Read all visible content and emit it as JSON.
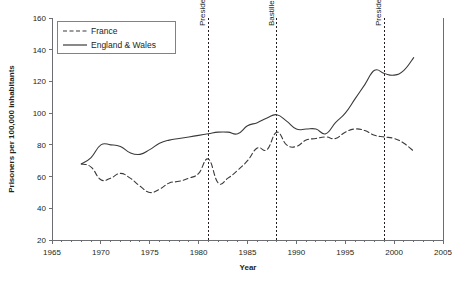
{
  "chart_data": {
    "type": "line",
    "title": "",
    "xlabel": "Year",
    "ylabel": "Prisoners per 100,000 inhabitants",
    "xlim": [
      1965,
      2005
    ],
    "ylim": [
      20,
      160
    ],
    "x_ticks": [
      1965,
      1970,
      1975,
      1980,
      1985,
      1990,
      1995,
      2000,
      2005
    ],
    "y_ticks": [
      20,
      40,
      60,
      80,
      100,
      120,
      140,
      160
    ],
    "x_minor_tick_step": 1,
    "grid": false,
    "legend_position": "top-left",
    "series": [
      {
        "name": "France",
        "style": "dashed",
        "color": "#3a3a3a",
        "x": [
          1968,
          1969,
          1970,
          1971,
          1972,
          1973,
          1974,
          1975,
          1976,
          1977,
          1978,
          1979,
          1980,
          1981,
          1982,
          1983,
          1984,
          1985,
          1986,
          1987,
          1988,
          1989,
          1990,
          1991,
          1992,
          1993,
          1994,
          1995,
          1996,
          1997,
          1998,
          1999,
          2000,
          2001,
          2002
        ],
        "values": [
          68,
          66,
          58,
          59,
          62,
          59,
          54,
          50,
          52,
          56,
          57,
          59,
          62,
          71,
          56,
          59,
          64,
          70,
          78,
          77,
          88,
          80,
          79,
          83,
          84,
          85,
          84,
          88,
          90,
          89,
          86,
          85,
          84,
          81,
          76
        ]
      },
      {
        "name": "England & Wales",
        "style": "solid",
        "color": "#3a3a3a",
        "x": [
          1968,
          1969,
          1970,
          1971,
          1972,
          1973,
          1974,
          1975,
          1976,
          1977,
          1978,
          1979,
          1980,
          1981,
          1982,
          1983,
          1984,
          1985,
          1986,
          1987,
          1988,
          1989,
          1990,
          1991,
          1992,
          1993,
          1994,
          1995,
          1996,
          1997,
          1998,
          1999,
          2000,
          2001,
          2002
        ],
        "values": [
          68,
          72,
          80,
          80,
          79,
          75,
          74,
          77,
          81,
          83,
          84,
          85,
          86,
          87,
          88,
          88,
          87,
          92,
          94,
          97,
          99,
          95,
          90,
          90,
          90,
          87,
          94,
          100,
          109,
          118,
          127,
          125,
          124,
          127,
          135
        ]
      }
    ],
    "annotations": [
      {
        "label": "Presidential Pardon",
        "x": 1981,
        "orientation": "vertical",
        "line_style": "dotted"
      },
      {
        "label": "Bastille Fall Pardon",
        "x": 1988,
        "orientation": "vertical",
        "line_style": "dotted"
      },
      {
        "label": "Presidential Pardon",
        "x": 1999,
        "orientation": "vertical",
        "line_style": "dotted"
      }
    ]
  },
  "legend": {
    "items": [
      {
        "label": "France"
      },
      {
        "label": "England & Wales"
      }
    ]
  }
}
